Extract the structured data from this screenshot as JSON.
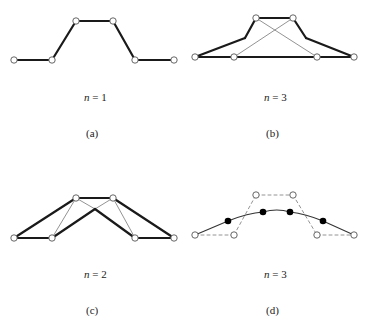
{
  "figure": {
    "panels": [
      {
        "id": "a",
        "caption": "(a)",
        "n_label": "n",
        "n_eq": " = 1",
        "control_points": [
          [
            14,
            60
          ],
          [
            52,
            60
          ],
          [
            76,
            21
          ],
          [
            113,
            21
          ],
          [
            135,
            60
          ],
          [
            174,
            60
          ]
        ],
        "bold_polyline": [
          [
            14,
            60
          ],
          [
            52,
            60
          ],
          [
            76,
            21
          ],
          [
            113,
            21
          ],
          [
            135,
            60
          ],
          [
            174,
            60
          ]
        ]
      },
      {
        "id": "b",
        "caption": "(b)",
        "n_label": "n",
        "n_eq": " = 3",
        "control_points": [
          [
            195,
            57
          ],
          [
            234,
            57
          ],
          [
            256,
            18
          ],
          [
            293,
            18
          ],
          [
            317,
            57
          ],
          [
            354,
            57
          ]
        ],
        "bold_segments": [
          [
            [
              195,
              57
            ],
            [
              354,
              57
            ]
          ],
          [
            [
              256,
              18
            ],
            [
              293,
              18
            ]
          ],
          [
            [
              195,
              57
            ],
            [
              245,
              38
            ]
          ],
          [
            [
              245,
              38
            ],
            [
              256,
              18
            ]
          ],
          [
            [
              354,
              57
            ],
            [
              306,
              38
            ]
          ],
          [
            [
              306,
              38
            ],
            [
              293,
              18
            ]
          ]
        ],
        "thin_segments": [
          [
            [
              234,
              57
            ],
            [
              293,
              18
            ]
          ],
          [
            [
              317,
              57
            ],
            [
              256,
              18
            ]
          ]
        ]
      },
      {
        "id": "c",
        "caption": "(c)",
        "n_label": "n",
        "n_eq": " = 2",
        "control_points": [
          [
            14,
            238
          ],
          [
            52,
            238
          ],
          [
            76,
            198
          ],
          [
            113,
            198
          ],
          [
            135,
            238
          ],
          [
            174,
            238
          ]
        ],
        "bold_segments": [
          [
            [
              14,
              238
            ],
            [
              76,
              198
            ]
          ],
          [
            [
              14,
              238
            ],
            [
              52,
              238
            ]
          ],
          [
            [
              52,
              238
            ],
            [
              95,
              209
            ]
          ],
          [
            [
              95,
              209
            ],
            [
              135,
              238
            ]
          ],
          [
            [
              76,
              198
            ],
            [
              113,
              198
            ]
          ],
          [
            [
              113,
              198
            ],
            [
              174,
              238
            ]
          ],
          [
            [
              135,
              238
            ],
            [
              174,
              238
            ]
          ]
        ],
        "thin_segments": [
          [
            [
              52,
              238
            ],
            [
              76,
              198
            ]
          ],
          [
            [
              76,
              198
            ],
            [
              95,
              209
            ]
          ],
          [
            [
              113,
              198
            ],
            [
              95,
              209
            ]
          ],
          [
            [
              113,
              198
            ],
            [
              135,
              238
            ]
          ]
        ]
      },
      {
        "id": "d",
        "caption": "(d)",
        "n_label": "n",
        "n_eq": " = 3",
        "control_points": [
          [
            195,
            235
          ],
          [
            234,
            235
          ],
          [
            256,
            195
          ],
          [
            293,
            195
          ],
          [
            317,
            235
          ],
          [
            354,
            235
          ]
        ],
        "curve_points": [
          [
            228,
            221
          ],
          [
            263,
            212
          ],
          [
            290,
            212
          ],
          [
            323,
            221
          ]
        ],
        "curve_path": "M195,235 L228,221 Q248,213 263,212 Q277,208 290,212 Q306,214 323,221 L354,235"
      }
    ],
    "colors": {
      "line": "#1a1a1a",
      "thin_line": "#777777",
      "dashed": "#888888",
      "circle_fill": "#ffffff",
      "circle_stroke": "#555555",
      "dot_fill": "#000000"
    }
  }
}
